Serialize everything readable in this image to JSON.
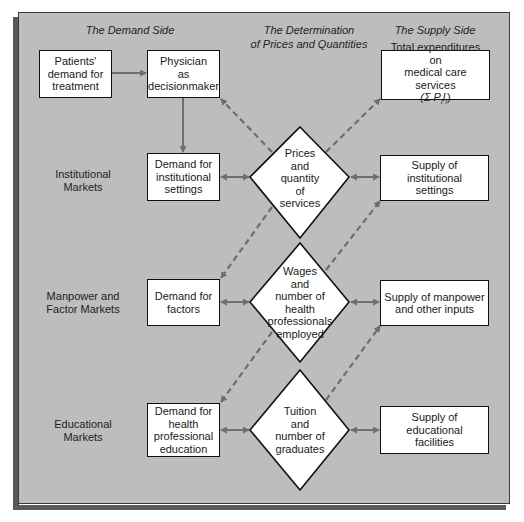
{
  "headers": {
    "demand_side": "The Demand Side",
    "determination_line1": "The Determination",
    "determination_line2": "of Prices and Quantities",
    "supply_side": "The Supply Side"
  },
  "row_labels": {
    "institutional": "Institutional\nMarkets",
    "manpower": "Manpower and\nFactor Markets",
    "educational": "Educational\nMarkets"
  },
  "demand_boxes": {
    "patients": "Patients'\ndemand for\ntreatment",
    "physician": "Physician\nas\ndecisionmaker",
    "institutional": "Demand for\ninstitutional\nsettings",
    "factors": "Demand for\nfactors",
    "education": "Demand for\nhealth\nprofessional\neducation"
  },
  "diamonds": {
    "prices": "Prices\nand\nquantity\nof\nservices",
    "wages": "Wages\nand\nnumber of\nhealth\nprofessionals\nemployed",
    "tuition": "Tuition\nand\nnumber of\ngraduates"
  },
  "supply_boxes": {
    "expenditures_line1": "Total expenditures on",
    "expenditures_line2": "medical care services",
    "expenditures_formula_prefix": "(Σ P",
    "expenditures_formula_sub1": "i",
    "expenditures_formula_mid": "I",
    "expenditures_formula_sub2": "i",
    "expenditures_formula_suffix": ")",
    "institutional": "Supply of institutional\nsettings",
    "manpower": "Supply of manpower\nand other inputs",
    "educational": "Supply of educational\nfacilities"
  },
  "colors": {
    "panel": "#bdbdbd",
    "shadow": "#5a5a5a",
    "arrow": "#6e6e6e",
    "box_fill": "#ffffff",
    "border": "#111111"
  }
}
